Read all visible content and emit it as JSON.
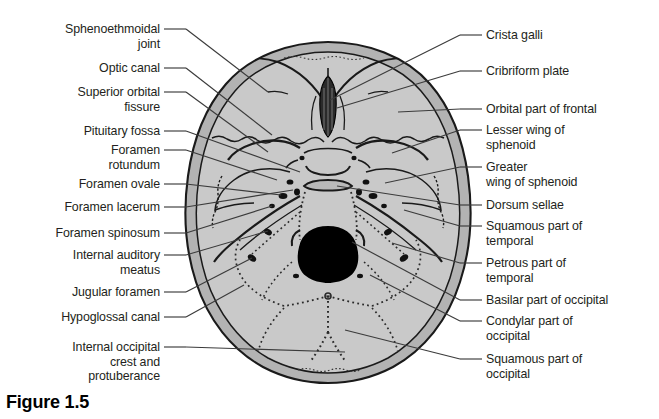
{
  "figure": {
    "caption": "Figure 1.5",
    "colors": {
      "outer_rim": "#b3b3b3",
      "inner_fill": "#c9c9c9",
      "outline": "#1a1a1a",
      "foramen_magnum": "#000000",
      "background": "#ffffff",
      "leader_line": "#3b3b3b",
      "text": "#231f20"
    }
  },
  "labels_left": [
    {
      "text": "Sphenoethmoidal\njoint",
      "x": 12,
      "y": 22,
      "w": 148,
      "dash_y": 29,
      "tip_x": 268,
      "tip_y": 92
    },
    {
      "text": "Optic canal",
      "x": 12,
      "y": 61,
      "w": 148,
      "dash_y": 68,
      "tip_x": 272,
      "tip_y": 135
    },
    {
      "text": "Superior orbital\nfissure",
      "x": 12,
      "y": 85,
      "w": 148,
      "dash_y": 92,
      "tip_x": 268,
      "tip_y": 152
    },
    {
      "text": "Pituitary fossa",
      "x": 12,
      "y": 124,
      "w": 148,
      "dash_y": 131,
      "tip_x": 300,
      "tip_y": 172
    },
    {
      "text": "Foramen\nrotundum",
      "x": 12,
      "y": 143,
      "w": 148,
      "dash_y": 150,
      "tip_x": 277,
      "tip_y": 180
    },
    {
      "text": "Foramen ovale",
      "x": 12,
      "y": 177,
      "w": 148,
      "dash_y": 184,
      "tip_x": 281,
      "tip_y": 195
    },
    {
      "text": "Foramen lacerum",
      "x": 12,
      "y": 200,
      "w": 148,
      "dash_y": 207,
      "tip_x": 293,
      "tip_y": 190
    },
    {
      "text": "Foramen spinosum",
      "x": 12,
      "y": 226,
      "w": 148,
      "dash_y": 233,
      "tip_x": 272,
      "tip_y": 206
    },
    {
      "text": "Internal auditory\nmeatus",
      "x": 12,
      "y": 248,
      "w": 148,
      "dash_y": 255,
      "tip_x": 268,
      "tip_y": 231
    },
    {
      "text": "Jugular foramen",
      "x": 12,
      "y": 285,
      "w": 148,
      "dash_y": 292,
      "tip_x": 252,
      "tip_y": 258
    },
    {
      "text": "Hypoglossal canal",
      "x": 12,
      "y": 310,
      "w": 148,
      "dash_y": 317,
      "tip_x": 244,
      "tip_y": 285
    },
    {
      "text": "Internal occipital\ncrest and\nprotuberance",
      "x": 12,
      "y": 340,
      "w": 148,
      "dash_y": 347,
      "tip_x": 345,
      "tip_y": 352
    }
  ],
  "labels_right": [
    {
      "text": "Crista galli",
      "x": 486,
      "y": 28,
      "dash_y": 35,
      "tip_x": 330,
      "tip_y": 100
    },
    {
      "text": "Cribriform plate",
      "x": 486,
      "y": 64,
      "dash_y": 71,
      "tip_x": 337,
      "tip_y": 108
    },
    {
      "text": "Orbital part of frontal",
      "x": 486,
      "y": 102,
      "dash_y": 109,
      "tip_x": 398,
      "tip_y": 112
    },
    {
      "text": "Lesser wing of\nsphenoid",
      "x": 486,
      "y": 123,
      "dash_y": 130,
      "tip_x": 392,
      "tip_y": 153
    },
    {
      "text": "Greater\nwing of sphenoid",
      "x": 486,
      "y": 160,
      "dash_y": 167,
      "tip_x": 385,
      "tip_y": 183
    },
    {
      "text": "Dorsum sellae",
      "x": 486,
      "y": 198,
      "dash_y": 205,
      "tip_x": 337,
      "tip_y": 186
    },
    {
      "text": "Squamous part of\ntemporal",
      "x": 486,
      "y": 219,
      "dash_y": 226,
      "tip_x": 404,
      "tip_y": 210
    },
    {
      "text": "Petrous part of\ntemporal",
      "x": 486,
      "y": 256,
      "dash_y": 263,
      "tip_x": 392,
      "tip_y": 243
    },
    {
      "text": "Basilar part of occipital",
      "x": 486,
      "y": 293,
      "dash_y": 300,
      "tip_x": 352,
      "tip_y": 242
    },
    {
      "text": "Condylar part of\noccipital",
      "x": 486,
      "y": 314,
      "dash_y": 321,
      "tip_x": 370,
      "tip_y": 275
    },
    {
      "text": "Squamous part of\noccipital",
      "x": 486,
      "y": 352,
      "dash_y": 359,
      "tip_x": 345,
      "tip_y": 330
    }
  ],
  "anatomy_regions": [
    {
      "name": "anterior-cranial-fossa",
      "note": "frontal/ethmoid region with crista galli and cribriform plate"
    },
    {
      "name": "middle-cranial-fossa",
      "note": "sphenoid wings, sella turcica, foramina rotundum/ovale/spinosum"
    },
    {
      "name": "posterior-cranial-fossa",
      "note": "occipital region with foramen magnum and internal occipital crest"
    },
    {
      "name": "foramen-magnum",
      "note": "large central black aperture"
    }
  ]
}
